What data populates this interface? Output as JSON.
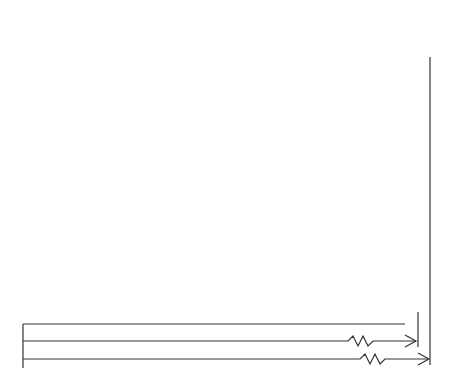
{
  "chart_data": {
    "type": "bar",
    "subtype": "floating-range",
    "xlabel": "LUMENS PER WATT",
    "ylabel": "",
    "x_ticks": [
      "0",
      "10",
      "20",
      "30",
      "40",
      "50",
      "60",
      "70",
      "80",
      "90",
      "100",
      "110",
      "120",
      "130",
      "140",
      "150",
      "160",
      "200",
      "600"
    ],
    "xlim": [
      0,
      600
    ],
    "grid": true,
    "series": [
      {
        "name": "CANDLE / OIL LAMP",
        "min": 0,
        "max": 3
      },
      {
        "name": "INCANDESCENT",
        "min": 5,
        "max": 22
      },
      {
        "name": "TUNGSTEN HALOGEN",
        "min": 18,
        "max": 24
      },
      {
        "name": "MERCURY",
        "min": 32,
        "max": 63
      },
      {
        "name": "FLUORESCENT",
        "min": 37,
        "max": 100
      },
      {
        "name": "METAL HALIDE",
        "min": 78,
        "max": 123
      },
      {
        "name": "HIGH PRESSURE SODIUM",
        "min": 66,
        "max": 141
      }
    ],
    "natural_light": [
      {
        "name": "SUN",
        "center": 101,
        "approx_range": [
          93,
          110
        ]
      },
      {
        "name": "SUN & SKY",
        "center": 116,
        "approx_range": [
          106,
          127
        ]
      },
      {
        "name": "SKY",
        "center": 146,
        "approx_range": [
          132,
          160
        ]
      }
    ],
    "theoretical_max": [
      {
        "name": "THEORETICAL MAX FOR WHITE LIGHT",
        "value": 200
      },
      {
        "name": "THEORETICAL MAX FOR MONOCROMATIC LIGHT",
        "value": 600
      }
    ]
  },
  "labels": {
    "ticks": [
      {
        "t": "0",
        "x": 20
      },
      {
        "t": "10",
        "x": 48
      },
      {
        "t": "20",
        "x": 72
      },
      {
        "t": "30",
        "x": 95
      },
      {
        "t": "40",
        "x": 119
      },
      {
        "t": "50",
        "x": 143
      },
      {
        "t": "60",
        "x": 166
      },
      {
        "t": "70",
        "x": 190
      },
      {
        "t": "80",
        "x": 213
      },
      {
        "t": "90",
        "x": 237
      },
      {
        "t": "100",
        "x": 260
      },
      {
        "t": "110",
        "x": 283
      },
      {
        "t": "120",
        "x": 307
      },
      {
        "t": "130",
        "x": 330
      },
      {
        "t": "140",
        "x": 354
      },
      {
        "t": "150",
        "x": 377
      },
      {
        "t": "160",
        "x": 401
      },
      {
        "t": "200",
        "x": 414
      },
      {
        "t": "600",
        "x": 426
      }
    ],
    "bars": [
      {
        "name": "CANDLE / OIL LAMP",
        "x": 23,
        "y": 63,
        "w": 9,
        "h": 24,
        "lx": 37,
        "ly": 69
      },
      {
        "name": "INCANDESCENT",
        "x": 38,
        "y": 102,
        "w": 39,
        "h": 24,
        "lx": 80,
        "ly": 108
      },
      {
        "name": "TUNGSTEN HALOGEN",
        "x": 66,
        "y": 140,
        "w": 15,
        "h": 24,
        "lx": 83,
        "ly": 147
      },
      {
        "name": "MERCURY",
        "x": 102,
        "y": 176,
        "w": 73,
        "h": 27,
        "lx": 178,
        "ly": 184
      },
      {
        "name": "FLUORESCENT",
        "x": 114,
        "y": 214,
        "w": 152,
        "h": 25,
        "lx": 267,
        "ly": 221
      },
      {
        "name": "METAL HALIDE",
        "x": 209,
        "y": 252,
        "w": 108,
        "h": 25,
        "lx": 318,
        "ly": 260
      },
      {
        "name": "HIGH PRESSURE SODIUM",
        "x": 182,
        "y": 288,
        "w": 177,
        "h": 25,
        "lx": 360,
        "ly": 290
      }
    ],
    "circles": [
      {
        "name": "SUN",
        "x": 247,
        "y": 66,
        "d": 40
      },
      {
        "name": "SUN & SKY",
        "x": 285,
        "y": 110,
        "d": 50
      },
      {
        "name": "SKY",
        "x": 343,
        "y": 90,
        "d": 68
      }
    ],
    "bands": [
      {
        "name": "THEORETICAL MAX FOR WHITE LIGHT",
        "lx": 88,
        "ly": 325
      },
      {
        "name": "THEORETICAL MAX FOR MONOCROMATIC LIGHT",
        "lx": 88,
        "ly": 342
      }
    ]
  }
}
